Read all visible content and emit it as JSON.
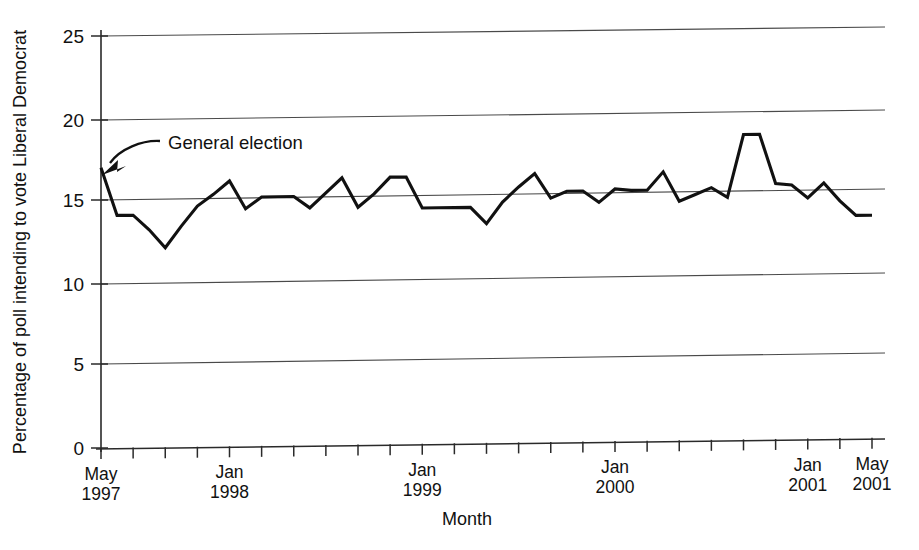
{
  "chart_data": {
    "type": "line",
    "title": "",
    "xlabel": "Month",
    "ylabel": "Percentage of poll intending to vote Liberal Democrat",
    "ylim": [
      0,
      25
    ],
    "yticks": [
      0,
      5,
      10,
      15,
      20,
      25
    ],
    "ytick_labels": [
      "0",
      "5",
      "10",
      "15",
      "20",
      "25"
    ],
    "grid": "horizontal",
    "legend": "none",
    "x_axis_type": "monthly",
    "x_start": "May 1997",
    "x_end": "May 2001",
    "x_tick_interval_months": 2,
    "x_major_labels": [
      {
        "label_line1": "May",
        "label_line2": "1997",
        "month_index": 0
      },
      {
        "label_line1": "Jan",
        "label_line2": "1998",
        "month_index": 8
      },
      {
        "label_line1": "Jan",
        "label_line2": "1999",
        "month_index": 20
      },
      {
        "label_line1": "Jan",
        "label_line2": "2000",
        "month_index": 32
      },
      {
        "label_line1": "Jan",
        "label_line2": "2001",
        "month_index": 44
      },
      {
        "label_line1": "May",
        "label_line2": "2001",
        "month_index": 48
      }
    ],
    "annotations": [
      {
        "text": "General election",
        "points_to_month_index": 0,
        "points_to_value": 17.0
      }
    ],
    "series": [
      {
        "name": "Liberal Democrat voting intention",
        "x": [
          "May 1997",
          "Jun 1997",
          "Jul 1997",
          "Aug 1997",
          "Sep 1997",
          "Oct 1997",
          "Nov 1997",
          "Dec 1997",
          "Jan 1998",
          "Feb 1998",
          "Mar 1998",
          "Apr 1998",
          "May 1998",
          "Jun 1998",
          "Jul 1998",
          "Aug 1998",
          "Sep 1998",
          "Oct 1998",
          "Nov 1998",
          "Dec 1998",
          "Jan 1999",
          "Feb 1999",
          "Mar 1999",
          "Apr 1999",
          "May 1999",
          "Jun 1999",
          "Jul 1999",
          "Aug 1999",
          "Sep 1999",
          "Oct 1999",
          "Nov 1999",
          "Dec 1999",
          "Jan 2000",
          "Feb 2000",
          "Mar 2000",
          "Apr 2000",
          "May 2000",
          "Jun 2000",
          "Jul 2000",
          "Aug 2000",
          "Sep 2000",
          "Oct 2000",
          "Nov 2000",
          "Dec 2000",
          "Jan 2001",
          "Feb 2001",
          "Mar 2001",
          "Apr 2001",
          "May 2001"
        ],
        "values": [
          17.0,
          14.1,
          14.1,
          13.2,
          12.1,
          13.4,
          14.6,
          15.3,
          16.1,
          14.4,
          15.1,
          15.1,
          15.1,
          14.4,
          15.3,
          16.2,
          14.4,
          15.2,
          16.2,
          16.2,
          14.3,
          14.3,
          14.3,
          14.3,
          13.3,
          14.6,
          15.5,
          16.3,
          14.8,
          15.2,
          15.2,
          14.5,
          15.3,
          15.2,
          15.2,
          16.3,
          14.5,
          14.9,
          15.3,
          14.7,
          18.5,
          18.5,
          15.5,
          15.4,
          14.6,
          15.5,
          14.4,
          13.5,
          13.5
        ]
      }
    ]
  },
  "figure": {
    "y_axis_label": "Percentage of poll intending to vote Liberal Democrat",
    "x_axis_label": "Month",
    "annotation_label": "General election",
    "ink_color": "#111111",
    "grid_color": "#4a4a4a",
    "background": "#ffffff"
  }
}
